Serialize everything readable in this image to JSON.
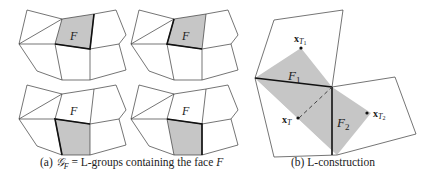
{
  "figure": {
    "panel_a": {
      "caption_prefix": "(a) ",
      "caption_symbol": "𝒢",
      "caption_subscript": "F",
      "caption_equals": " = L-groups containing the face ",
      "caption_face": "F",
      "face_label": "F",
      "subpanels": [
        {
          "position": "top-left",
          "shaded": "face F"
        },
        {
          "position": "top-right",
          "shaded": "face F"
        },
        {
          "position": "bottom-left",
          "shaded": "face below F"
        },
        {
          "position": "bottom-right",
          "shaded": "face below F"
        }
      ]
    },
    "panel_b": {
      "caption": "(b) L-construction",
      "labels": {
        "F1": "F",
        "F1_sub": "1",
        "F2": "F",
        "F2_sub": "2",
        "xT": "x",
        "xT_sub": "T",
        "xT1": "x",
        "xT1_sub": "T",
        "xT1_subsub": "1",
        "xT2": "x",
        "xT2_sub": "T",
        "xT2_subsub": "2"
      }
    },
    "colors": {
      "shade": "#c6c6c6",
      "line": "#3a3a3a",
      "bold_line": "#111111"
    }
  }
}
